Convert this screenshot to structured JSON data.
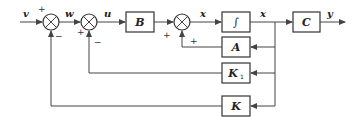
{
  "diagram": {
    "type": "block-diagram",
    "signals": {
      "input": "v",
      "after_sum1": "w",
      "after_sum2": "u",
      "after_sum3": "x",
      "state": "x",
      "output": "y"
    },
    "blocks": {
      "B": "B",
      "integrator": "∫",
      "C": "C",
      "A": "A",
      "K1_main": "K",
      "K1_sub": "1",
      "K": "K"
    },
    "summing_junctions": [
      {
        "id": "sum1",
        "signs": {
          "top_left": "+",
          "bottom": "−"
        }
      },
      {
        "id": "sum2",
        "signs": {
          "left_bottom": "+",
          "bottom": "−"
        }
      },
      {
        "id": "sum3",
        "signs": {
          "left_bottom": "+",
          "bottom": "+"
        }
      }
    ],
    "colors": {
      "line": "#444444",
      "background": "#ffffff"
    }
  }
}
